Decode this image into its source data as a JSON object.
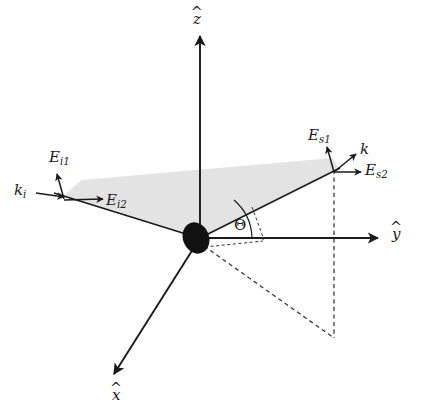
{
  "figure": {
    "background_color": "#ffffff",
    "line_color": "#1a1a1a",
    "plane_fill_color": "#e2e2e2",
    "dash_color": "#333333"
  },
  "axes": [
    {
      "id": "z",
      "base": "z",
      "accent": "^",
      "label_x": 193,
      "label_y": 12,
      "from": [
        200,
        238
      ],
      "to": [
        200,
        34
      ]
    },
    {
      "id": "y",
      "base": "y",
      "accent": "^",
      "label_x": 392,
      "label_y": 227,
      "from": [
        200,
        238
      ],
      "to": [
        381,
        238
      ]
    },
    {
      "id": "x",
      "base": "x",
      "accent": "^",
      "label_x": 112,
      "label_y": 388,
      "from": [
        200,
        238
      ],
      "to": [
        112,
        376
      ]
    }
  ],
  "vectors": [
    {
      "id": "k_i",
      "base": "k",
      "sub": "i",
      "label_x": 14,
      "label_y": 183,
      "from": [
        36,
        193
      ],
      "to": [
        63,
        197
      ]
    },
    {
      "id": "E_i1",
      "base": "E",
      "sub": "i1",
      "label_x": 49,
      "label_y": 150,
      "from": [
        64,
        199
      ],
      "to": [
        57,
        172
      ]
    },
    {
      "id": "E_i2",
      "base": "E",
      "sub": "i2",
      "label_x": 106,
      "label_y": 193,
      "from": [
        64,
        200
      ],
      "to": [
        104,
        199
      ]
    },
    {
      "id": "E_s1",
      "base": "E",
      "sub": "s1",
      "label_x": 308,
      "label_y": 128,
      "from": [
        334,
        172
      ],
      "to": [
        327,
        145
      ]
    },
    {
      "id": "k",
      "base": "k",
      "sub": "",
      "label_x": 360,
      "label_y": 142,
      "from": [
        334,
        172
      ],
      "to": [
        355,
        155
      ]
    },
    {
      "id": "E_s2",
      "base": "E",
      "sub": "s2",
      "label_x": 365,
      "label_y": 163,
      "from": [
        334,
        172
      ],
      "to": [
        362,
        172
      ]
    }
  ],
  "beams": [
    {
      "id": "incident-beam",
      "from": [
        54,
        193
      ],
      "to": [
        200,
        238
      ]
    },
    {
      "id": "scattered-beam",
      "from": [
        200,
        238
      ],
      "to": [
        340,
        168
      ]
    }
  ],
  "angle": {
    "id": "theta",
    "symbol": "Θ",
    "label_x": 234,
    "label_y": 218,
    "vertex": [
      200,
      238
    ],
    "arc_radius": 52,
    "between": [
      "scattered-beam",
      "y-axis"
    ]
  },
  "scattering_plane": {
    "id": "scattering-plane",
    "points": "63,196 200,238 338,168 333,158 82,180",
    "fill": "#e3e3e3"
  },
  "origin_marker": {
    "id": "scatterer",
    "cx": 196,
    "cy": 238,
    "rx": 13,
    "ry": 16,
    "rotation": -22,
    "fill": "#111111"
  },
  "dashed_lines": [
    {
      "id": "projection-vertical",
      "from": [
        334,
        172
      ],
      "to": [
        334,
        338
      ]
    },
    {
      "id": "projection-diagonal",
      "from": [
        203,
        245
      ],
      "to": [
        334,
        338
      ]
    },
    {
      "id": "angle-tick-upper",
      "from": [
        252,
        208
      ],
      "to": [
        262,
        238
      ]
    },
    {
      "id": "angle-tick-lower",
      "from": [
        205,
        247
      ],
      "to": [
        262,
        240
      ]
    },
    {
      "id": "angle-tick-right",
      "from": [
        262,
        238
      ],
      "to": [
        262,
        242
      ]
    }
  ]
}
